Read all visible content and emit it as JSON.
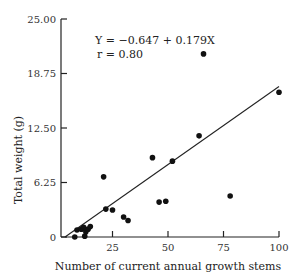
{
  "chart_data": {
    "type": "scatter",
    "title": "",
    "xlabel": "Number of current annual growth stems",
    "ylabel": "Total weight (g)",
    "xlim": [
      0,
      100
    ],
    "ylim": [
      0,
      25
    ],
    "x_ticks": [
      25,
      50,
      75,
      100
    ],
    "x_tick_labels": [
      "25",
      "50",
      "75",
      "100"
    ],
    "y_ticks": [
      0,
      6.25,
      12.5,
      18.75,
      25
    ],
    "y_tick_labels": [
      "0",
      "6.25",
      "12.50",
      "18.75",
      "25.00"
    ],
    "grid": false,
    "legend": null,
    "series": [
      {
        "name": "observations",
        "points": [
          {
            "x": 8,
            "y": 0.0
          },
          {
            "x": 12.5,
            "y": 0.1
          },
          {
            "x": 9,
            "y": 0.8
          },
          {
            "x": 11,
            "y": 0.9
          },
          {
            "x": 12,
            "y": 1.1
          },
          {
            "x": 13,
            "y": 0.6
          },
          {
            "x": 14,
            "y": 0.9
          },
          {
            "x": 15,
            "y": 1.2
          },
          {
            "x": 21,
            "y": 6.9
          },
          {
            "x": 22,
            "y": 3.2
          },
          {
            "x": 25,
            "y": 3.1
          },
          {
            "x": 30,
            "y": 2.3
          },
          {
            "x": 32,
            "y": 1.9
          },
          {
            "x": 43,
            "y": 9.1
          },
          {
            "x": 46,
            "y": 4.0
          },
          {
            "x": 49,
            "y": 4.1
          },
          {
            "x": 52,
            "y": 8.7
          },
          {
            "x": 64,
            "y": 11.6
          },
          {
            "x": 66,
            "y": 21.0
          },
          {
            "x": 78,
            "y": 4.7
          },
          {
            "x": 100,
            "y": 16.6
          }
        ]
      }
    ],
    "regression": {
      "intercept": -0.647,
      "slope": 0.179,
      "x_range": [
        3.6,
        100
      ]
    },
    "annotations": {
      "equation": "Y = −0.647 + 0.179X",
      "r": "r = 0.80"
    }
  }
}
